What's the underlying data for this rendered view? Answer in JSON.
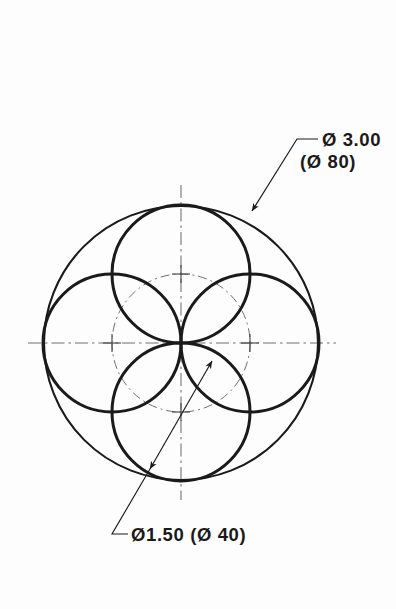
{
  "document": {
    "type": "engineering-drawing",
    "title": "Four-circle rosette pattern",
    "background_color": "#fdfdfd",
    "line_color": "#1a1a1a",
    "construction_line_color": "#6e6e6e"
  },
  "annotations": {
    "outer_diameter": {
      "line1": "Ø 3.00",
      "line2": "(Ø 80)",
      "leader_name": "outer-circle-leader"
    },
    "small_diameter": {
      "line1": "Ø1.50  (Ø 40)",
      "leader_name": "small-circle-dimension-leader"
    }
  },
  "geometry": {
    "center": {
      "x": 181,
      "y": 343
    },
    "outer_circle": {
      "cx": 181,
      "cy": 343,
      "r": 137,
      "stroke_width": 2.1
    },
    "bolt_circle": {
      "cx": 181,
      "cy": 343,
      "r": 69,
      "stroke_width": 1.0,
      "dash": "9,4,2,4"
    },
    "small_circles": [
      {
        "name": "small-circle-top",
        "cx": 181,
        "cy": 274,
        "r": 69
      },
      {
        "name": "small-circle-right",
        "cx": 250,
        "cy": 343,
        "r": 69
      },
      {
        "name": "small-circle-bottom",
        "cx": 181,
        "cy": 412,
        "r": 69
      },
      {
        "name": "small-circle-left",
        "cx": 112,
        "cy": 343,
        "r": 69
      }
    ],
    "small_circle_stroke_width": 3.0,
    "center_marks": [
      {
        "name": "center-mark-top",
        "x": 181,
        "y": 274
      },
      {
        "name": "center-mark-right",
        "x": 250,
        "y": 343
      },
      {
        "name": "center-mark-bottom",
        "x": 181,
        "y": 412
      },
      {
        "name": "center-mark-left",
        "x": 112,
        "y": 343
      }
    ],
    "centerlines": {
      "horizontal": {
        "x1": 28,
        "y1": 343,
        "x2": 336,
        "y2": 343
      },
      "vertical": {
        "x1": 181,
        "y1": 185,
        "x2": 181,
        "y2": 500
      }
    },
    "outer_leader": {
      "arrow_tip": {
        "x": 252,
        "y": 211
      },
      "elbow": {
        "x": 297,
        "y": 139
      },
      "shelf_end": {
        "x": 318,
        "y": 139
      }
    },
    "small_leader": {
      "arrow_tip_upper": {
        "x": 212,
        "y": 361
      },
      "arrow_tip_lower": {
        "x": 150,
        "y": 469
      },
      "tail_end": {
        "x": 112,
        "y": 534
      },
      "shelf_end": {
        "x": 128,
        "y": 534
      }
    }
  },
  "chart_data": {
    "type": "diagram",
    "entities": [
      {
        "label": "Ø 3.00 / (Ø 80)",
        "kind": "outer circle",
        "diameter_in": 3.0,
        "diameter_mm": 80
      },
      {
        "label": "Ø1.50 / (Ø 40)",
        "kind": "small circle",
        "count": 4,
        "diameter_in": 1.5,
        "diameter_mm": 40
      }
    ]
  }
}
